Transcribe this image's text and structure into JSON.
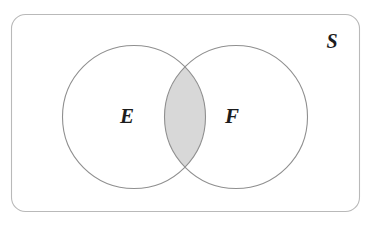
{
  "figure": {
    "type": "venn-diagram",
    "title": ""
  },
  "universal_set": {
    "label": "S",
    "name": "sample-space"
  },
  "sets": [
    {
      "id": "E",
      "label": "E",
      "name": "event-e"
    },
    {
      "id": "F",
      "label": "F",
      "name": "event-f"
    }
  ],
  "regions": [
    {
      "id": "intersection",
      "label": "",
      "shaded": true
    }
  ],
  "colors": {
    "background": "#ffffff",
    "box_stroke": "#b9b9b9",
    "circle_stroke": "#8f8f8f",
    "intersection_fill": "#d8d8d8",
    "intersection_stroke": "#8f8f8f",
    "label_color": "#1c1c1c"
  },
  "geometry": {
    "box": {
      "x": 11,
      "y": 14,
      "width": 349,
      "height": 198,
      "radius": 14
    },
    "circle_left": {
      "cx": 134,
      "cy": 117,
      "r": 71.5
    },
    "circle_right": {
      "cx": 236,
      "cy": 117,
      "r": 71.5
    },
    "label_e_pos": {
      "x": 127,
      "y": 117
    },
    "label_f_pos": {
      "x": 232,
      "y": 117
    },
    "label_s_pos": {
      "x": 332,
      "y": 42
    }
  }
}
